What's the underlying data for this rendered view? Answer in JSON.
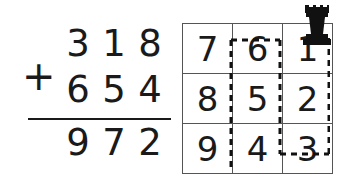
{
  "addition": {
    "operator": "+",
    "addend_top": "318",
    "addend_top_digits": [
      "3",
      "1",
      "8"
    ],
    "addend_bottom": "654",
    "addend_bottom_digits": [
      "6",
      "5",
      "4"
    ],
    "sum": "972",
    "sum_digits": [
      "9",
      "7",
      "2"
    ]
  },
  "grid": {
    "rows": [
      [
        "7",
        "6",
        "1"
      ],
      [
        "8",
        "5",
        "2"
      ],
      [
        "9",
        "4",
        "3"
      ]
    ],
    "columns": 3,
    "row_count": 3
  },
  "overlay": {
    "path_style": "dashed",
    "path_color": "#111111",
    "description": "dashed route tracing cell borders through the grid"
  },
  "rook": {
    "label": "black-chess-rook",
    "color": "#111111",
    "position": "top-right corner of grid, column 3"
  }
}
